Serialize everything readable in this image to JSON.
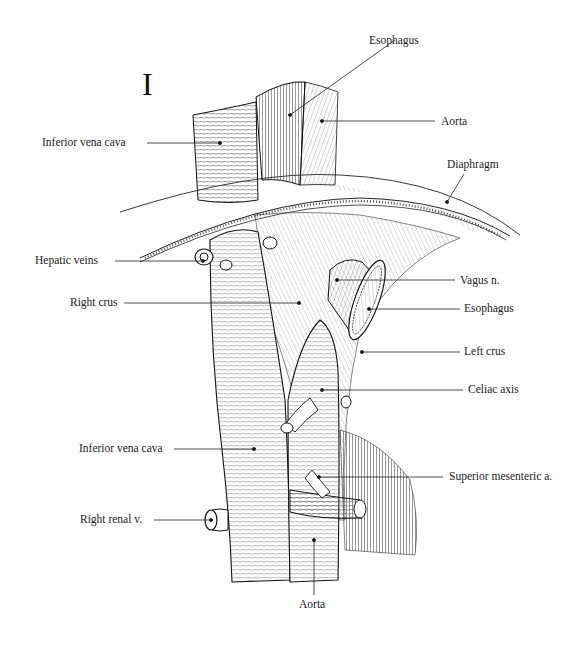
{
  "figure": {
    "panel_label": "I",
    "labels": {
      "esophagus_top": "Esophagus",
      "aorta_top": "Aorta",
      "ivc_top": "Inferior vena cava",
      "diaphragm": "Diaphragm",
      "hepatic_veins": "Hepatic veins",
      "vagus": "Vagus n.",
      "right_crus": "Right crus",
      "esophagus_mid": "Esophagus",
      "left_crus": "Left crus",
      "celiac": "Celiac axis",
      "ivc_bottom": "Inferior vena cava",
      "sma": "Superior mesenteric a.",
      "right_renal": "Right renal v.",
      "aorta_bottom": "Aorta"
    }
  }
}
